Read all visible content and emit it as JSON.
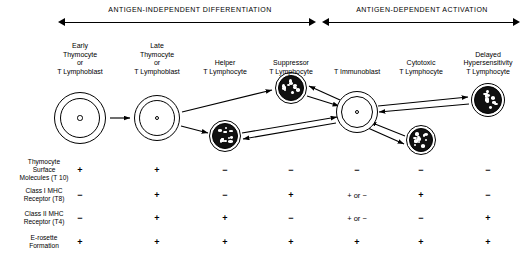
{
  "phases": [
    {
      "label": "ANTIGEN-INDEPENDENT  DIFFERENTIATION",
      "cx": 190,
      "x": 58,
      "w": 258
    },
    {
      "label": "ANTIGEN-DEPENDENT  ACTIVATION",
      "cx": 422,
      "x": 322,
      "w": 198
    }
  ],
  "columns": [
    {
      "id": "early-thymocyte",
      "label": "Early\nThymocyte\nor\nT Lymphoblast",
      "x": 80
    },
    {
      "id": "late-thymocyte",
      "label": "Late\nThymocyte\nor\nT Lymphoblast",
      "x": 157
    },
    {
      "id": "helper",
      "label": "Helper\nT Lymphocyte",
      "x": 225
    },
    {
      "id": "suppressor",
      "label": "Suppressor\nT Lymphocyte",
      "x": 291
    },
    {
      "id": "t-immunoblast",
      "label": "T Immunoblast",
      "x": 357
    },
    {
      "id": "cytotoxic",
      "label": "Cytotoxic\nT Lymphocyte",
      "x": 421
    },
    {
      "id": "delayed",
      "label": "Delayed\nHypersensitivity\nT Lymphocyte",
      "x": 488
    }
  ],
  "cells": [
    {
      "id": "cell-early-thymocyte",
      "type": "pale",
      "cx": 80,
      "cy": 118,
      "r": 26
    },
    {
      "id": "cell-late-thymocyte",
      "type": "pale",
      "cx": 157,
      "cy": 118,
      "r": 23
    },
    {
      "id": "cell-helper",
      "type": "dark",
      "cx": 225,
      "cy": 136,
      "r": 16
    },
    {
      "id": "cell-suppressor",
      "type": "dark",
      "cx": 291,
      "cy": 88,
      "r": 16
    },
    {
      "id": "cell-t-immunoblast",
      "type": "pale",
      "cx": 357,
      "cy": 112,
      "r": 21
    },
    {
      "id": "cell-cytotoxic",
      "type": "dark",
      "cx": 421,
      "cy": 140,
      "r": 15
    },
    {
      "id": "cell-delayed",
      "type": "dark",
      "cx": 488,
      "cy": 100,
      "r": 17
    }
  ],
  "table": {
    "rows": [
      {
        "id": "t10",
        "label": "Thymocyte\nSurface\nMolecules (T 10)",
        "y": 170,
        "values": [
          "+",
          "+",
          "−",
          "−",
          "−",
          "−",
          "−"
        ]
      },
      {
        "id": "t8",
        "label": "Class I  MHC\nReceptor (T8)",
        "y": 195,
        "values": [
          "−",
          "+",
          "−",
          "+",
          "+ or −",
          "+",
          "−"
        ]
      },
      {
        "id": "t4",
        "label": "Class II  MHC\nReceptor (T4)",
        "y": 218,
        "values": [
          "−",
          "+",
          "+",
          "−",
          "+ or −",
          "−",
          "+"
        ]
      },
      {
        "id": "erosette",
        "label": "E-rosette\nFormation",
        "y": 242,
        "values": [
          "+",
          "+",
          "+",
          "+",
          "+",
          "+",
          "+"
        ]
      }
    ],
    "label_x": 44
  },
  "colors": {
    "ink": "#000000",
    "paper": "#ffffff"
  }
}
